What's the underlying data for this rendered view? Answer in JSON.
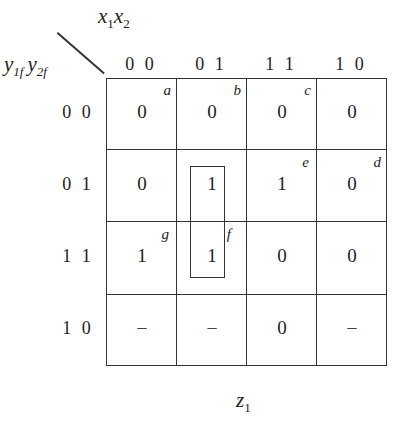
{
  "kmap": {
    "output_label": "z",
    "output_subscript": "1",
    "column_vars": {
      "v1": "x",
      "v1_sub": "1",
      "v2": "x",
      "v2_sub": "2"
    },
    "row_vars": {
      "v1": "y",
      "v1_sub": "1f",
      "v2": "y",
      "v2_sub": "2f"
    },
    "column_headers": [
      "0 0",
      "0 1",
      "1 1",
      "1 0"
    ],
    "row_headers": [
      "0 0",
      "0 1",
      "1 1",
      "1 0"
    ],
    "cells": [
      [
        "0",
        "0",
        "0",
        "0"
      ],
      [
        "0",
        "1",
        "1",
        "0"
      ],
      [
        "1",
        "1",
        "0",
        "0"
      ],
      [
        "–",
        "–",
        "0",
        "–"
      ]
    ],
    "state_tags": {
      "a": "a",
      "b": "b",
      "c": "c",
      "d": "d",
      "e": "e",
      "f": "f",
      "g": "g"
    },
    "loops": [
      {
        "column": "01",
        "rows": [
          "01",
          "11"
        ],
        "value": "1"
      }
    ]
  }
}
